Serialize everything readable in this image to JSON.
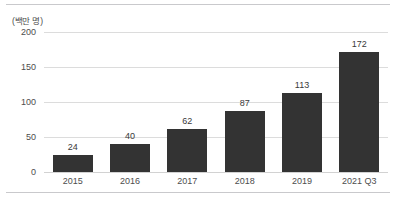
{
  "chart_data": {
    "type": "bar",
    "title": "",
    "subtitle": "",
    "unit_label": "(백만 명)",
    "xlabel": "",
    "ylabel": "",
    "categories": [
      "2015",
      "2016",
      "2017",
      "2018",
      "2019",
      "2021 Q3"
    ],
    "values": [
      24,
      40,
      62,
      87,
      113,
      172
    ],
    "ylim": [
      0,
      200
    ],
    "yticks": [
      0,
      50,
      100,
      150,
      200
    ],
    "ytick_labels": [
      "0",
      "50",
      "100",
      "150",
      "200"
    ],
    "grid": true,
    "legend": false,
    "legend_position": "none",
    "bar_color": "#333333",
    "gridline_color": "#dcdcdc",
    "background_color": "#ffffff",
    "data_labels": [
      "24",
      "40",
      "62",
      "87",
      "113",
      "172"
    ]
  }
}
